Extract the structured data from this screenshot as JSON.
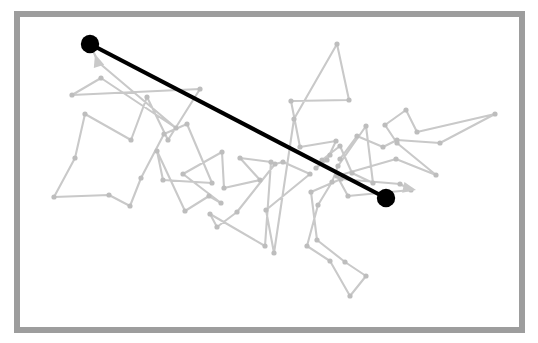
{
  "figure": {
    "type": "random-walk-displacement-diagram",
    "caption": "",
    "canvas": {
      "width": 538,
      "height": 343
    },
    "background_color": "#ffffff"
  },
  "frame": {
    "name": "panel-border",
    "x": 14,
    "y": 11,
    "width": 511,
    "height": 322,
    "stroke_color": "#9d9d9d",
    "stroke_width": 6,
    "fill_color": "#ffffff"
  },
  "style": {
    "walk_stroke_color": "#c9c9c9",
    "walk_stroke_width": 2.1,
    "walk_vertex_color": "#bdbdbd",
    "walk_vertex_radius": 2.6,
    "displacement_stroke_color": "#000000",
    "displacement_stroke_width": 4.2,
    "endpoint_marker_color": "#000000",
    "endpoint_marker_radius": 9.2,
    "arrowhead_color": "#c9c9c9"
  },
  "chart_data": {
    "type": "scatter",
    "title": "",
    "subtitle": "",
    "xlabel": "",
    "ylabel": "",
    "xlim": [
      14,
      525
    ],
    "ylim": [
      11,
      333
    ],
    "grid": false,
    "legend": null,
    "annotations": [],
    "series": [
      {
        "name": "random-walk-path",
        "kind": "polyline-with-vertices",
        "color": "#c9c9c9",
        "closed": false,
        "points": [
          [
            90,
            44
          ],
          [
            98,
            62
          ],
          [
            176,
            128
          ],
          [
            101,
            78
          ],
          [
            72,
            95
          ],
          [
            200,
            89
          ],
          [
            168,
            140
          ],
          [
            147,
            97
          ],
          [
            131,
            140
          ],
          [
            85,
            114
          ],
          [
            75,
            158
          ],
          [
            54,
            197
          ],
          [
            109,
            195
          ],
          [
            130,
            206
          ],
          [
            141,
            178
          ],
          [
            164,
            134
          ],
          [
            187,
            124
          ],
          [
            212,
            183
          ],
          [
            163,
            180
          ],
          [
            157,
            151
          ],
          [
            185,
            211
          ],
          [
            209,
            196
          ],
          [
            221,
            203
          ],
          [
            183,
            174
          ],
          [
            222,
            152
          ],
          [
            224,
            188
          ],
          [
            260,
            180
          ],
          [
            240,
            158
          ],
          [
            271,
            162
          ],
          [
            265,
            246
          ],
          [
            210,
            214
          ],
          [
            217,
            227
          ],
          [
            237,
            212
          ],
          [
            275,
            164
          ],
          [
            283,
            162
          ],
          [
            310,
            174
          ],
          [
            266,
            210
          ],
          [
            274,
            253
          ],
          [
            294,
            119
          ],
          [
            337,
            44
          ],
          [
            349,
            100
          ],
          [
            291,
            101
          ],
          [
            300,
            147
          ],
          [
            336,
            141
          ],
          [
            327,
            160
          ],
          [
            316,
            168
          ],
          [
            330,
            155
          ],
          [
            322,
            160
          ],
          [
            340,
            146
          ],
          [
            352,
            173
          ],
          [
            373,
            183
          ],
          [
            366,
            126
          ],
          [
            338,
            166
          ],
          [
            332,
            182
          ],
          [
            318,
            205
          ],
          [
            307,
            246
          ],
          [
            330,
            261
          ],
          [
            350,
            296
          ],
          [
            366,
            276
          ],
          [
            345,
            262
          ],
          [
            317,
            240
          ],
          [
            311,
            192
          ],
          [
            341,
            179
          ],
          [
            400,
            184
          ],
          [
            411,
            190
          ],
          [
            348,
            196
          ],
          [
            337,
            176
          ],
          [
            396,
            159
          ],
          [
            436,
            175
          ],
          [
            397,
            143
          ],
          [
            385,
            125
          ],
          [
            406,
            110
          ],
          [
            417,
            132
          ],
          [
            495,
            114
          ],
          [
            440,
            143
          ],
          [
            397,
            140
          ],
          [
            383,
            147
          ],
          [
            357,
            136
          ],
          [
            340,
            159
          ]
        ]
      },
      {
        "name": "displacement-vector",
        "kind": "segment",
        "color": "#000000",
        "points": [
          [
            90,
            44
          ],
          [
            386,
            198
          ]
        ]
      },
      {
        "name": "endpoint-markers",
        "kind": "points",
        "color": "#000000",
        "points": [
          [
            90,
            44
          ],
          [
            386,
            198
          ]
        ],
        "labels": [
          "start-point",
          "end-point"
        ]
      }
    ],
    "arrowheads": [
      {
        "name": "walk-arrowhead-upper-left",
        "tip": [
          95,
          54
        ],
        "angle_deg": -108,
        "size": 13
      },
      {
        "name": "walk-arrowhead-right",
        "tip": [
          416,
          190
        ],
        "angle_deg": 12,
        "size": 13
      }
    ]
  }
}
